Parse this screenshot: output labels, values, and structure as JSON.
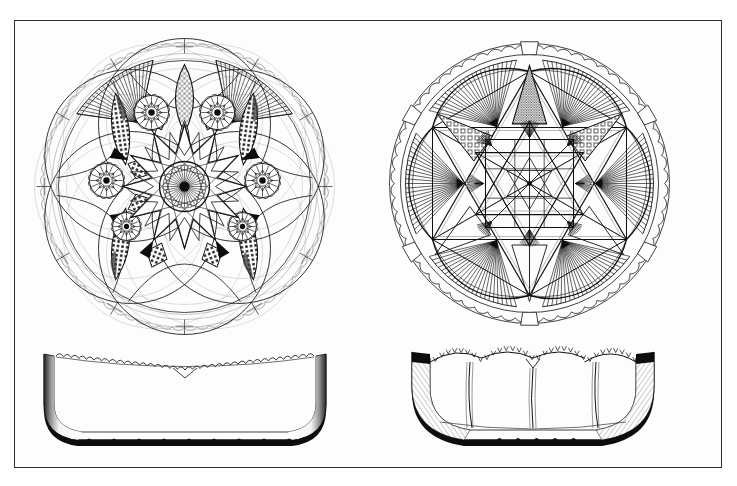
{
  "document": {
    "kind": "line-engraving-plate",
    "background_color": "#ffffff",
    "paper_color": "#fdfdfd",
    "ink_color": "#111111",
    "frame": {
      "x": 14,
      "y": 20,
      "width": 708,
      "height": 448,
      "stroke_color": "#2e2e2e",
      "stroke_width": 1.3
    },
    "caption": "",
    "figure_count": 4
  },
  "figures": [
    {
      "id": "left-plan",
      "title": "",
      "view": "plan",
      "shape": "circular-dish",
      "center": {
        "cx": 184,
        "cy": 186
      },
      "radii": {
        "outer_scallop": 148,
        "rim_band": 139,
        "design": 128,
        "center_hub": 24
      },
      "motifs": {
        "scallops": 72,
        "petal_vesicas": 12,
        "hobstar_rosettes": 6,
        "fans": 2,
        "crosshatch_vesicas": 3,
        "center_star_points": 12,
        "center_hub_rays": 36
      },
      "fill_styles": [
        "scallop-edge",
        "vesica-crosshatch",
        "radial-fan",
        "stipple-triangle",
        "hobstar"
      ]
    },
    {
      "id": "right-plan",
      "title": "",
      "view": "plan",
      "shape": "circular-dish",
      "center": {
        "cx": 529,
        "cy": 183
      },
      "radii": {
        "outer_scallop": 147,
        "rim_band": 136,
        "design": 126,
        "center_hub": 12
      },
      "motifs": {
        "scallops": 60,
        "star_points": 6,
        "fans": 6,
        "crosshatch_triangles": 2,
        "stipple_triangles": 1,
        "small_fans": 8,
        "lattice_cells": 9
      },
      "fill_styles": [
        "scallop-edge",
        "square-crosshatch",
        "radial-fan",
        "stipple-triangle",
        "lattice-star"
      ]
    },
    {
      "id": "left-profile",
      "title": "",
      "view": "elevation",
      "shape": "flat-bottom-bowl",
      "bounds": {
        "x": 42,
        "y": 350,
        "width": 285,
        "height": 98
      },
      "motifs": {
        "rim_teeth": 34,
        "foot_notches": 9,
        "wall_panels": 2
      },
      "fill_styles": [
        "sawtooth-rim",
        "shaded-wall",
        "dark-foot"
      ]
    },
    {
      "id": "right-profile",
      "title": "",
      "view": "elevation",
      "shape": "round-bottom-bowl",
      "bounds": {
        "x": 411,
        "y": 350,
        "width": 240,
        "height": 98
      },
      "motifs": {
        "rim_teeth": 30,
        "interior_panels": 4,
        "foot_notches": 5
      },
      "fill_styles": [
        "sawtooth-rim",
        "hatched-wall",
        "dark-foot"
      ]
    }
  ],
  "palette": {
    "ink": "#111111",
    "mid_ink": "#3a3a3a",
    "faint_ink": "#8d8d8d",
    "very_faint_ink": "#b4b4b4",
    "solid_black": "#0d0d0d",
    "paper": "#fdfdfd",
    "frame": "#2e2e2e"
  }
}
